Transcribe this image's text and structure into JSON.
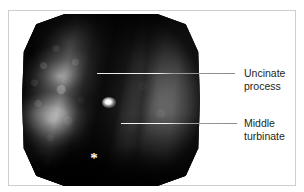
{
  "figure": {
    "top_caption_fragment": "",
    "frame_color": "#cfcfcf",
    "background_color": "#ffffff"
  },
  "endoscope_image": {
    "modality": "endoscopic-photograph",
    "color_mode": "grayscale",
    "shape": "truncated-circle",
    "markers": [
      {
        "name": "asterisk-marker",
        "glyph": "*",
        "color": "#ffffff",
        "x": 85,
        "y": 148
      },
      {
        "name": "specular-highlight",
        "color": "#ffffff",
        "x": 100,
        "y": 92
      }
    ]
  },
  "annotations": [
    {
      "id": "uncinate",
      "line_1": "Uncinate",
      "line_2": "process",
      "leader_from_x": 88,
      "leader_from_y": 62,
      "leader_to_x": 226,
      "leader_to_y": 62,
      "text_color": "#231f20"
    },
    {
      "id": "turbinate",
      "line_1": "Middle",
      "line_2": "turbinate",
      "leader_from_x": 112,
      "leader_from_y": 112,
      "leader_to_x": 228,
      "leader_to_y": 112,
      "text_color": "#231f20"
    }
  ]
}
